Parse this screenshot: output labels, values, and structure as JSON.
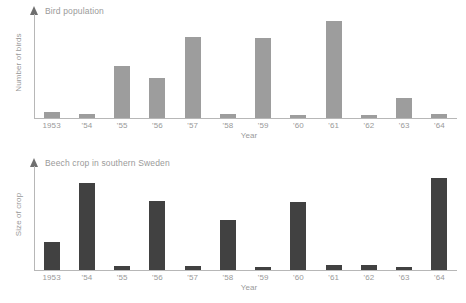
{
  "charts": [
    {
      "id": "bird",
      "title": "Bird population",
      "ylabel": "Number of birds",
      "xlabel": "Year",
      "bar_color": "#9d9d9d"
    },
    {
      "id": "beech",
      "title": "Beech crop in southern Sweden",
      "ylabel": "Size of crop",
      "xlabel": "Year",
      "bar_color": "#414141"
    }
  ],
  "chart_data": [
    {
      "type": "bar",
      "title": "Bird population",
      "xlabel": "Year",
      "ylabel": "Number of birds",
      "categories": [
        "1953",
        "'54",
        "'55",
        "'56",
        "'57",
        "'58",
        "'59",
        "'60",
        "'61",
        "'62",
        "'63",
        "'64"
      ],
      "values": [
        6,
        4,
        50,
        38,
        78,
        4,
        77,
        3,
        93,
        3,
        19,
        4
      ],
      "ylim": [
        0,
        100
      ],
      "grid": false,
      "legend": "none",
      "bar_color": "#9d9d9d"
    },
    {
      "type": "bar",
      "title": "Beech crop in southern Sweden",
      "xlabel": "Year",
      "ylabel": "Size of crop",
      "categories": [
        "1953",
        "'54",
        "'55",
        "'56",
        "'57",
        "'58",
        "'59",
        "'60",
        "'61",
        "'62",
        "'63",
        "'64"
      ],
      "values": [
        27,
        84,
        4,
        66,
        4,
        48,
        3,
        65,
        5,
        5,
        3,
        88
      ],
      "ylim": [
        0,
        100
      ],
      "grid": false,
      "legend": "none",
      "bar_color": "#414141"
    }
  ]
}
